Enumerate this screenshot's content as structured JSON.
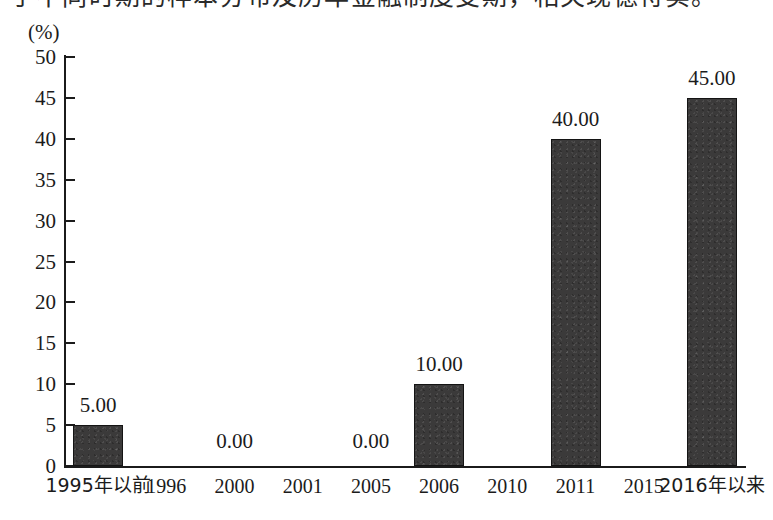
{
  "page": {
    "clipped_top_line": "了不同时期的样本分布及历年金融制度变期，相关现德符实。"
  },
  "chart_data": {
    "type": "bar",
    "title": "",
    "subtitle": "",
    "xlabel": "",
    "ylabel": "(%)",
    "unit_label": "(%)",
    "categories": [
      "1995年以前",
      "1996",
      "2000",
      "2001",
      "2005",
      "2006",
      "2010",
      "2011",
      "2015",
      "2016年以来"
    ],
    "values": [
      5.0,
      null,
      0.0,
      null,
      0.0,
      10.0,
      null,
      40.0,
      null,
      45.0
    ],
    "bars": [
      {
        "category": "1995年以前",
        "value": 5.0,
        "label": "5.00",
        "index": 0
      },
      {
        "category": "2006",
        "value": 10.0,
        "label": "10.00",
        "index": 5
      },
      {
        "category": "2011",
        "value": 40.0,
        "label": "40.00",
        "index": 7
      },
      {
        "category": "2016年以来",
        "value": 45.0,
        "label": "45.00",
        "index": 9
      }
    ],
    "zero_labels": [
      {
        "label": "0.00",
        "index": 2
      },
      {
        "label": "0.00",
        "index": 4
      }
    ],
    "data_labels": [
      "5.00",
      "0.00",
      "0.00",
      "10.00",
      "40.00",
      "45.00"
    ],
    "ylim": [
      0,
      50
    ],
    "yticks": [
      0,
      5,
      10,
      15,
      20,
      25,
      30,
      35,
      40,
      45,
      50
    ],
    "ytick_labels": [
      "0",
      "5",
      "10",
      "15",
      "20",
      "25",
      "30",
      "35",
      "40",
      "45",
      "50"
    ],
    "grid": false,
    "legend": false,
    "legend_position": "none",
    "colors": {
      "bar_fill": "#3b3a3a",
      "bar_edge": "#141414",
      "axis": "#1b1b1b",
      "background": "#ffffff",
      "text": "#1b1b1b"
    }
  }
}
